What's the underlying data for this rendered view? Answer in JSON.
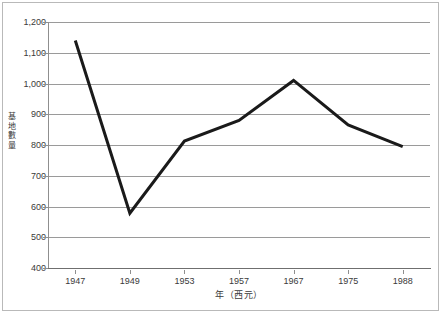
{
  "chart_data": {
    "type": "line",
    "title": "",
    "subtitle": "",
    "xlabel": "年（西元）",
    "ylabel": "基地數量",
    "categories": [
      "1947",
      "1949",
      "1953",
      "1957",
      "1967",
      "1975",
      "1988"
    ],
    "values": [
      1140,
      578,
      813,
      880,
      1010,
      865,
      795
    ],
    "series": [
      {
        "name": "基地數量",
        "values": [
          1140,
          578,
          813,
          880,
          1010,
          865,
          795
        ]
      }
    ],
    "ylim": [
      400,
      1200
    ],
    "ytick_step": 100,
    "ytick_labels": [
      "400",
      "500",
      "600",
      "700",
      "800",
      "900",
      "1,000",
      "1,100",
      "1,200"
    ],
    "ytick_values": [
      400,
      500,
      600,
      700,
      800,
      900,
      1000,
      1100,
      1200
    ],
    "grid": "horizontal",
    "legend": "none",
    "line_color": "#1a1a1a",
    "grid_color": "#9a9a9a",
    "axis_color": "#8f8f8f",
    "text_color": "#3a3a3a",
    "background": "#ffffff",
    "annotations": []
  },
  "figure": {
    "border_color": "#b9b9b9"
  }
}
